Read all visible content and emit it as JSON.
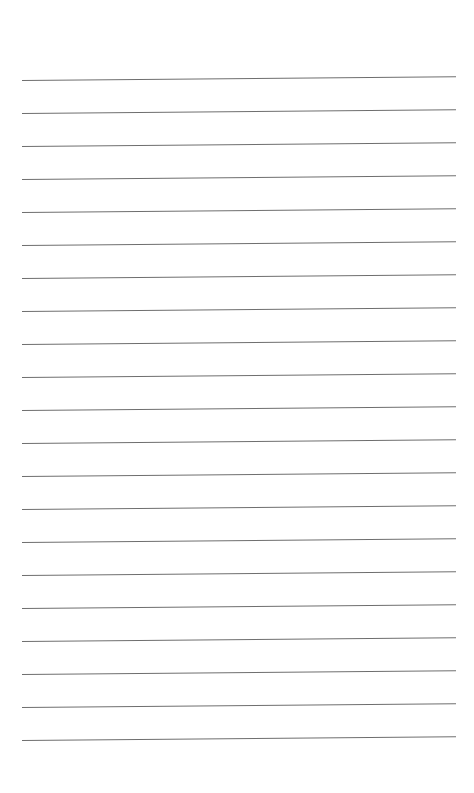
{
  "page": {
    "type": "lined-paper",
    "background_color": "#ffffff",
    "line_color": "#6e6e6e",
    "line_count": 21,
    "first_line_y": 80,
    "line_spacing": 33,
    "line_left_x": 22,
    "line_right_x": 456,
    "text": ""
  }
}
